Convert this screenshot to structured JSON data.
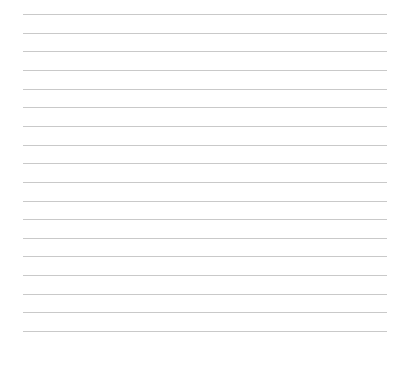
{
  "page": {
    "type": "lined-paper",
    "line_count": 18,
    "first_line_y": 14,
    "line_spacing": 18.65,
    "line_left": 23,
    "line_right": 387,
    "line_color": "#c9c9c9",
    "background_color": "#ffffff"
  }
}
